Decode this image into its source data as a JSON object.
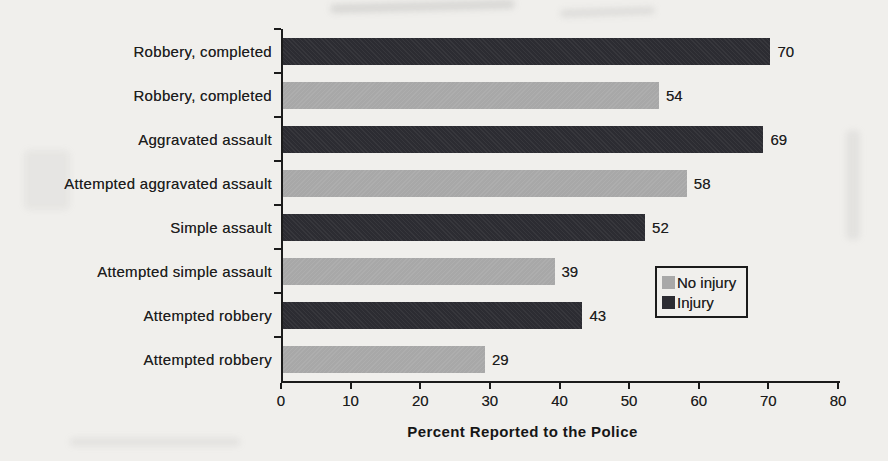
{
  "page": {
    "background_color": "#f0efec",
    "text_color": "#1d1d1d"
  },
  "chart_data": {
    "type": "bar",
    "orientation": "horizontal",
    "xlabel": "Percent Reported to the Police",
    "xlim": [
      0,
      80
    ],
    "x_ticks": [
      0,
      10,
      20,
      30,
      40,
      50,
      60,
      70,
      80
    ],
    "grid": false,
    "value_labels_shown": true,
    "legend_position": "middle-right-inside",
    "legend": [
      {
        "label": "No injury",
        "color": "#a8a8a8",
        "series_key": "no-injury"
      },
      {
        "label": "Injury",
        "color": "#2c2c32",
        "series_key": "injury"
      }
    ],
    "bars": [
      {
        "category": "Robbery, completed",
        "series": "Injury",
        "series_key": "injury",
        "value": 70
      },
      {
        "category": "Robbery, completed",
        "series": "No injury",
        "series_key": "no-injury",
        "value": 54
      },
      {
        "category": "Aggravated assault",
        "series": "Injury",
        "series_key": "injury",
        "value": 69
      },
      {
        "category": "Attempted aggravated assault",
        "series": "No injury",
        "series_key": "no-injury",
        "value": 58
      },
      {
        "category": "Simple assault",
        "series": "Injury",
        "series_key": "injury",
        "value": 52
      },
      {
        "category": "Attempted simple assault",
        "series": "No injury",
        "series_key": "no-injury",
        "value": 39
      },
      {
        "category": "Attempted robbery",
        "series": "Injury",
        "series_key": "injury",
        "value": 43
      },
      {
        "category": "Attempted robbery",
        "series": "No injury",
        "series_key": "no-injury",
        "value": 29
      }
    ]
  }
}
